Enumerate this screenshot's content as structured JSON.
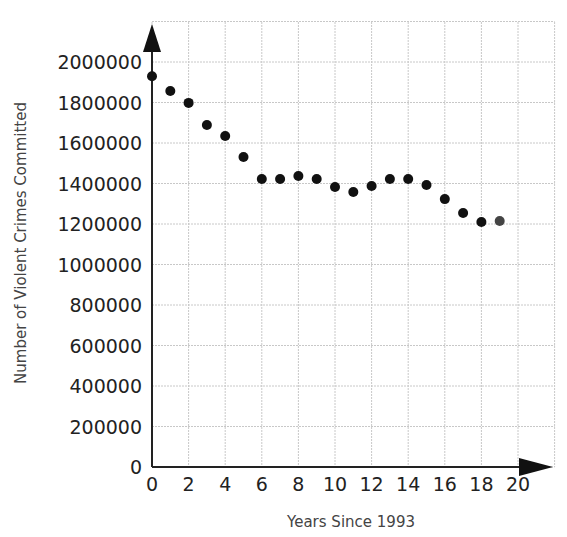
{
  "chart_data": {
    "type": "scatter",
    "title": "",
    "xlabel": "Years Since 1993",
    "ylabel": "Number of Violent Crimes Committed",
    "x": [
      0,
      1,
      2,
      3,
      4,
      5,
      6,
      7,
      8,
      9,
      10,
      11,
      12,
      13,
      14,
      15,
      16,
      17,
      18,
      19
    ],
    "values": [
      1930000,
      1857000,
      1798000,
      1689000,
      1635000,
      1531000,
      1422000,
      1422000,
      1437000,
      1422000,
      1383000,
      1358000,
      1388000,
      1422000,
      1422000,
      1393000,
      1323000,
      1254000,
      1210000,
      1215000
    ],
    "xticks": [
      "0",
      "2",
      "4",
      "6",
      "8",
      "10",
      "12",
      "14",
      "16",
      "18",
      "20"
    ],
    "yticks": [
      "0",
      "200000",
      "400000",
      "600000",
      "800000",
      "1000000",
      "1200000",
      "1400000",
      "1600000",
      "1800000",
      "2000000"
    ],
    "xlim": [
      0,
      22
    ],
    "ylim": [
      0,
      2200000
    ],
    "grid": true,
    "legend": null,
    "colors": {
      "points": "#111111",
      "grid": "#c8c8c8",
      "axis": "#222222"
    }
  }
}
